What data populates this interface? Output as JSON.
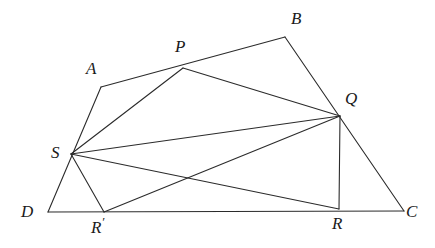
{
  "figure": {
    "canvas": {
      "width": 435,
      "height": 248,
      "background": "#ffffff"
    },
    "stroke": {
      "color": "#2b2b2b",
      "width": 1.1
    },
    "labels": {
      "A": "A",
      "B": "B",
      "C": "C",
      "D": "D",
      "P": "P",
      "Q": "Q",
      "R": "R",
      "R_prime": "R",
      "R_prime_mark": "′",
      "S": "S"
    },
    "points": {
      "A": {
        "x": 101,
        "y": 87
      },
      "B": {
        "x": 285,
        "y": 37
      },
      "C": {
        "x": 404,
        "y": 211
      },
      "D": {
        "x": 48,
        "y": 212
      },
      "P": {
        "x": 183,
        "y": 68
      },
      "Q": {
        "x": 340,
        "y": 116
      },
      "R": {
        "x": 339,
        "y": 209
      },
      "R_prime": {
        "x": 104,
        "y": 212
      },
      "S": {
        "x": 71,
        "y": 154
      }
    },
    "label_positions": {
      "A": {
        "x": 86,
        "y": 60
      },
      "B": {
        "x": 291,
        "y": 10
      },
      "C": {
        "x": 406,
        "y": 203
      },
      "D": {
        "x": 21,
        "y": 203
      },
      "P": {
        "x": 175,
        "y": 38
      },
      "Q": {
        "x": 345,
        "y": 90
      },
      "R": {
        "x": 332,
        "y": 215
      },
      "R_prime": {
        "x": 91,
        "y": 215
      },
      "S": {
        "x": 51,
        "y": 144
      }
    },
    "segments": [
      {
        "name": "side-AB",
        "from": "A",
        "to": "B"
      },
      {
        "name": "side-BC",
        "from": "B",
        "to": "C"
      },
      {
        "name": "side-CD",
        "from": "C",
        "to": "D"
      },
      {
        "name": "side-DA",
        "from": "D",
        "to": "A"
      },
      {
        "name": "chord-SP",
        "from": "S",
        "to": "P"
      },
      {
        "name": "chord-PQ",
        "from": "P",
        "to": "Q"
      },
      {
        "name": "chord-QR",
        "from": "Q",
        "to": "R"
      },
      {
        "name": "chord-SQ",
        "from": "S",
        "to": "Q"
      },
      {
        "name": "chord-SR",
        "from": "S",
        "to": "R"
      },
      {
        "name": "chord-SRprime",
        "from": "S",
        "to": "R_prime"
      },
      {
        "name": "chord-RprimeQ",
        "from": "R_prime",
        "to": "Q"
      }
    ]
  }
}
